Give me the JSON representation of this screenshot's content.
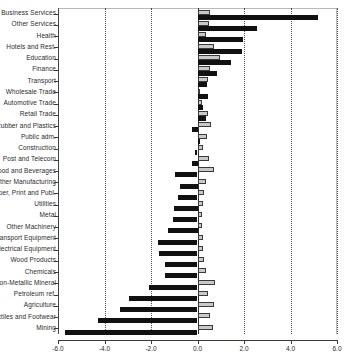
{
  "chart_data": {
    "type": "bar",
    "orientation": "horizontal",
    "title": "",
    "subtitle": "",
    "xlabel": "",
    "ylabel": "",
    "xlim": [
      -6.0,
      6.0
    ],
    "xticks": [
      -6.0,
      -4.0,
      -2.0,
      0.0,
      2.0,
      4.0,
      6.0
    ],
    "xtick_labels": [
      "-6.0",
      "-4.0",
      "-2.0",
      "0.0",
      "2.0",
      "4.0",
      "6.0"
    ],
    "grid": "vertical-dotted-at-xticks",
    "legend": "none",
    "zero_line": true,
    "categories": [
      "Business Services",
      "Other Services",
      "Health",
      "Hotels and Rest.",
      "Education",
      "Finance",
      "Transport",
      "Wholesale Trade",
      "Automotive Trade",
      "Retail Trade",
      "Rubber and Plastics",
      "Public adm.",
      "Construction",
      "Post and Telecom",
      "Food and Beverages",
      "Other Manufacturing",
      "Paper, Print and Publ.",
      "Utilities",
      "Metal",
      "Other Machinery",
      "Transport Equipment",
      "Electrical Equipment",
      "Wood Products",
      "Chemicals",
      "Non-Metallic Mineral",
      "Petroleum ref.",
      "Agriculture",
      "Textiles and Footwear",
      "Mining"
    ],
    "series": [
      {
        "name": "series-gray",
        "color": "#c9c9c9",
        "values": [
          0.55,
          0.5,
          0.35,
          0.7,
          0.95,
          0.55,
          0.45,
          0.0,
          0.2,
          0.45,
          0.6,
          0.4,
          0.25,
          0.5,
          0.7,
          0.35,
          0.3,
          0.25,
          0.2,
          0.2,
          0.25,
          0.25,
          0.3,
          0.35,
          0.75,
          0.45,
          0.7,
          0.55,
          0.65
        ]
      },
      {
        "name": "series-black",
        "color": "#111111",
        "values": [
          5.2,
          2.55,
          1.95,
          1.9,
          1.45,
          0.85,
          0.4,
          0.45,
          0.22,
          0.35,
          -0.25,
          0.0,
          -0.1,
          -0.25,
          -0.95,
          -0.75,
          -0.85,
          -1.0,
          -1.05,
          -1.25,
          -1.7,
          -1.65,
          -1.4,
          -1.4,
          -2.1,
          -2.95,
          -3.35,
          -4.3,
          -5.7
        ]
      }
    ]
  }
}
